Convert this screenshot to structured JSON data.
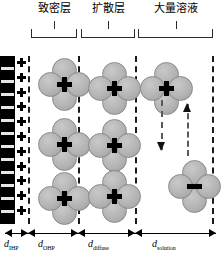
{
  "figure": {
    "type": "electric-double-layer-diagram",
    "zones": [
      {
        "id": "compact",
        "label": "致密层",
        "meaning": "compact layer"
      },
      {
        "id": "diffuse",
        "label": "扩散层",
        "meaning": "diffusion layer"
      },
      {
        "id": "bulk",
        "label": "大量溶液",
        "meaning": "bulk solution"
      }
    ],
    "electrode": {
      "name": "charged-electrode",
      "surface_charge_symbol": "+",
      "surface_charge_count": 11,
      "fill": "#000000"
    },
    "ions": {
      "cation_symbol": "+",
      "anion_symbol": "−",
      "solvation_shell_count": 4,
      "shell_color": "#b2b2b2",
      "core_color": "#000000",
      "clusters": [
        {
          "zone": "compact",
          "charge": "+",
          "x": 38,
          "y": 58
        },
        {
          "zone": "compact",
          "charge": "+",
          "x": 38,
          "y": 118
        },
        {
          "zone": "compact",
          "charge": "+",
          "x": 38,
          "y": 172
        },
        {
          "zone": "diffuse",
          "charge": "+",
          "x": 88,
          "y": 62
        },
        {
          "zone": "diffuse",
          "charge": "+",
          "x": 88,
          "y": 119
        },
        {
          "zone": "diffuse",
          "charge": "+",
          "x": 88,
          "y": 170
        },
        {
          "zone": "bulk",
          "charge": "+",
          "x": 140,
          "y": 62
        },
        {
          "zone": "bulk",
          "charge": "−",
          "x": 168,
          "y": 160
        }
      ]
    },
    "motion_arrows": [
      {
        "name": "cation-migration-arrow",
        "direction": "down",
        "x": 157,
        "y": 100,
        "length": 50
      },
      {
        "name": "anion-migration-arrow",
        "direction": "up",
        "x": 183,
        "y": 104,
        "length": 52
      }
    ],
    "boundaries": [
      {
        "name": "inner-helmholtz-plane",
        "x": 28
      },
      {
        "name": "outer-helmholtz-plane",
        "x": 78
      },
      {
        "name": "diffuse-layer-boundary",
        "x": 135
      },
      {
        "name": "bulk-solution-boundary",
        "x": 212
      }
    ],
    "axis": {
      "name": "distance-axis",
      "segments": [
        {
          "id": "ihp",
          "symbol": "d",
          "subscript": "IHP",
          "start": 5,
          "end": 28
        },
        {
          "id": "ohp",
          "symbol": "d",
          "subscript": "OHP",
          "start": 28,
          "end": 78
        },
        {
          "id": "diffuse",
          "symbol": "d",
          "subscript": "diffuse",
          "start": 78,
          "end": 135
        },
        {
          "id": "solution",
          "symbol": "d",
          "subscript": "solution",
          "start": 135,
          "end": 216
        }
      ],
      "labels": [
        {
          "id": "ihp",
          "text": "d",
          "sub": "IHP",
          "x": 4
        },
        {
          "id": "ohp",
          "text": "d",
          "sub": "OHP",
          "x": 38
        },
        {
          "id": "diffuse",
          "text": "d",
          "sub": "diffuse",
          "x": 88
        },
        {
          "id": "solution",
          "text": "d",
          "sub": "solution",
          "x": 152
        }
      ]
    }
  }
}
